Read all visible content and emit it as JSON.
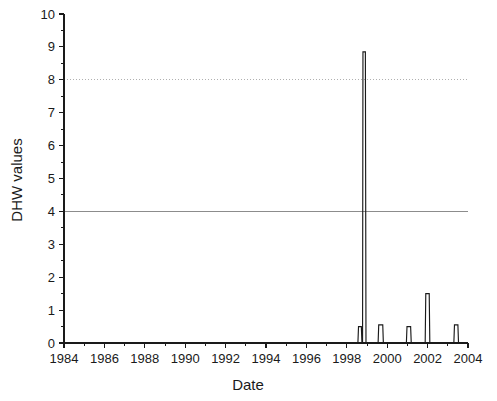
{
  "chart_data": {
    "type": "line",
    "title": "",
    "xlabel": "Date",
    "ylabel": "DHW values",
    "xlim": [
      1984,
      2004
    ],
    "ylim": [
      0,
      10
    ],
    "grid": false,
    "legend": null,
    "x_tick_labels": [
      "1984",
      "1986",
      "1988",
      "1990",
      "1992",
      "1994",
      "1996",
      "1998",
      "2000",
      "2002",
      "2004"
    ],
    "x_tick_values": [
      1984,
      1986,
      1988,
      1990,
      1992,
      1994,
      1996,
      1998,
      2000,
      2002,
      2004
    ],
    "x_minor_interval": 1,
    "y_tick_labels": [
      "0",
      "1",
      "2",
      "3",
      "4",
      "5",
      "6",
      "7",
      "8",
      "9",
      "10"
    ],
    "y_tick_values": [
      0,
      1,
      2,
      3,
      4,
      5,
      6,
      7,
      8,
      9,
      10
    ],
    "y_minor_interval": 0.5,
    "reference_lines": [
      {
        "name": "bleaching-threshold-4",
        "value": 4,
        "style": "solid",
        "color": "#8c8c8c"
      },
      {
        "name": "severe-threshold-8",
        "value": 8,
        "style": "dotted",
        "color": "#b0b0b0"
      }
    ],
    "series": [
      {
        "name": "DHW",
        "color": "#1a1a1a",
        "points": [
          [
            1984.0,
            0
          ],
          [
            1998.55,
            0
          ],
          [
            1998.58,
            0.5
          ],
          [
            1998.72,
            0.5
          ],
          [
            1998.75,
            0
          ],
          [
            1998.78,
            0
          ],
          [
            1998.8,
            8.85
          ],
          [
            1998.92,
            8.85
          ],
          [
            1998.95,
            0
          ],
          [
            1999.55,
            0
          ],
          [
            1999.58,
            0.55
          ],
          [
            1999.78,
            0.55
          ],
          [
            1999.81,
            0
          ],
          [
            2000.95,
            0
          ],
          [
            2000.98,
            0.5
          ],
          [
            2001.16,
            0.5
          ],
          [
            2001.19,
            0
          ],
          [
            2001.88,
            0
          ],
          [
            2001.91,
            1.5
          ],
          [
            2002.08,
            1.5
          ],
          [
            2002.11,
            0
          ],
          [
            2003.3,
            0
          ],
          [
            2003.33,
            0.55
          ],
          [
            2003.5,
            0.55
          ],
          [
            2003.53,
            0
          ],
          [
            2004.0,
            0
          ]
        ]
      }
    ],
    "events": [
      {
        "year": 1998.65,
        "value": 0.5,
        "label": "pre-peak shoulder"
      },
      {
        "year": 1998.86,
        "value": 8.85,
        "label": "1998 peak"
      },
      {
        "year": 1999.68,
        "value": 0.55,
        "label": "1999 event"
      },
      {
        "year": 2001.07,
        "value": 0.5,
        "label": "2001 event"
      },
      {
        "year": 2002.0,
        "value": 1.5,
        "label": "2002 event"
      },
      {
        "year": 2003.41,
        "value": 0.55,
        "label": "2003 event"
      }
    ]
  }
}
